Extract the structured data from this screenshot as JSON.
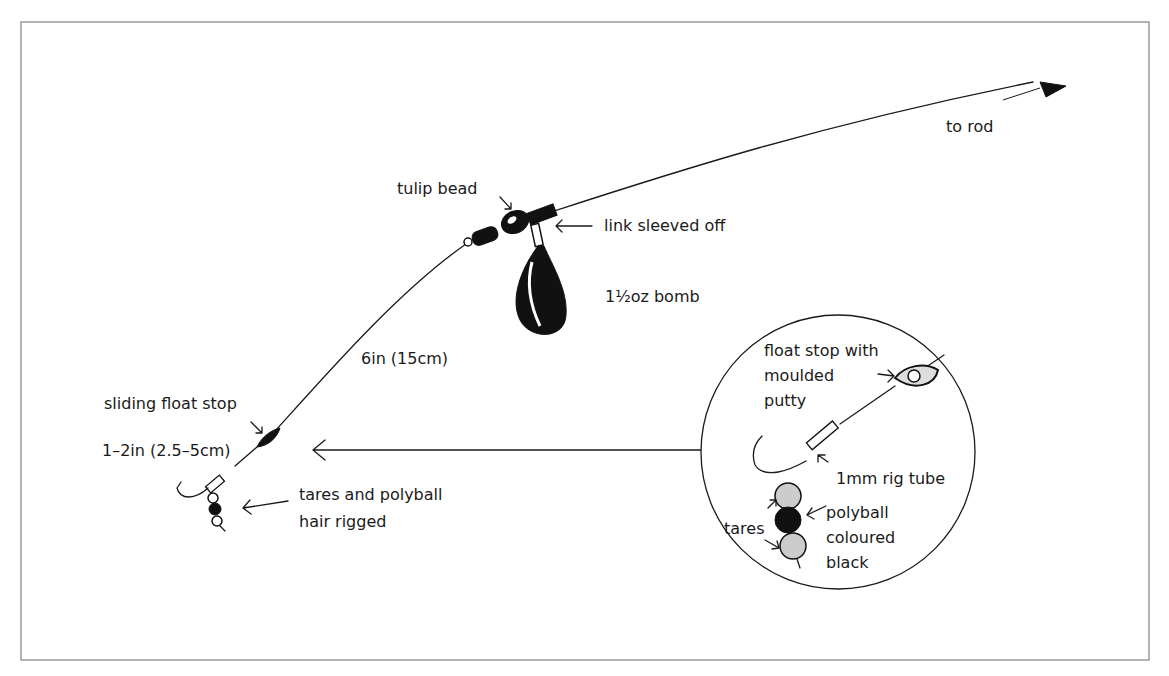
{
  "diagram": {
    "type": "fishing-rig-illustration",
    "colors": {
      "ink": "#1a1a1a",
      "frame": "#8a8a8a",
      "background": "#ffffff"
    },
    "labels": {
      "to_rod": "to rod",
      "tulip_bead": "tulip bead",
      "link_sleeved_off": "link sleeved off",
      "bomb": "1½oz bomb",
      "hooklength": "6in (15cm)",
      "sliding_float_stop": "sliding float stop",
      "hair_length": "1–2in (2.5–5cm)",
      "tares_polyball_line1": "tares and polyball",
      "tares_polyball_line2": "hair rigged"
    },
    "inset": {
      "float_stop_line1": "float stop with",
      "float_stop_line2": "moulded",
      "float_stop_line3": "putty",
      "rig_tube": "1mm rig tube",
      "tares": "tares",
      "polyball_line1": "polyball",
      "polyball_line2": "coloured",
      "polyball_line3": "black"
    }
  }
}
